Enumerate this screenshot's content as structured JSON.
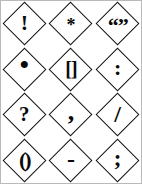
{
  "sheet": {
    "title": "Punctuation marks in diamonds",
    "background_color": "#ffffff",
    "border_color": "#b9b9b9",
    "ink_color": "#0a0a0a",
    "columns": 3,
    "rows": 4
  },
  "cells": [
    {
      "glyph": "!",
      "name": "exclamation-mark",
      "icon": "diamond-exclamation-icon"
    },
    {
      "glyph": "*",
      "name": "asterisk",
      "icon": "diamond-asterisk-icon"
    },
    {
      "glyph": "“”",
      "name": "double-quotation-marks",
      "icon": "diamond-quotation-icon"
    },
    {
      "glyph": "•",
      "name": "period-dot",
      "icon": "diamond-period-icon"
    },
    {
      "glyph": "[]",
      "name": "square-brackets",
      "icon": "diamond-brackets-icon"
    },
    {
      "glyph": ":",
      "name": "colon",
      "icon": "diamond-colon-icon"
    },
    {
      "glyph": "?",
      "name": "question-mark",
      "icon": "diamond-question-icon"
    },
    {
      "glyph": ",",
      "name": "comma",
      "icon": "diamond-comma-icon"
    },
    {
      "glyph": "/",
      "name": "forward-slash",
      "icon": "diamond-slash-icon"
    },
    {
      "glyph": "()",
      "name": "parentheses",
      "icon": "diamond-parentheses-icon"
    },
    {
      "glyph": "-",
      "name": "hyphen-dash",
      "icon": "diamond-hyphen-icon"
    },
    {
      "glyph": ";",
      "name": "semicolon",
      "icon": "diamond-semicolon-icon"
    }
  ]
}
